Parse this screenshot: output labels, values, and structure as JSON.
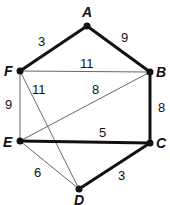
{
  "graph": {
    "nodes": [
      {
        "id": "A",
        "label": "A",
        "x": 87,
        "y": 26
      },
      {
        "id": "B",
        "label": "B",
        "x": 150,
        "y": 72
      },
      {
        "id": "C",
        "label": "C",
        "x": 150,
        "y": 143
      },
      {
        "id": "D",
        "label": "D",
        "x": 79,
        "y": 189
      },
      {
        "id": "E",
        "label": "E",
        "x": 20,
        "y": 141
      },
      {
        "id": "F",
        "label": "F",
        "x": 20,
        "y": 71
      }
    ],
    "edges": [
      {
        "from": "F",
        "to": "A",
        "weight": "3",
        "bold": true
      },
      {
        "from": "A",
        "to": "B",
        "weight": "9",
        "bold": true
      },
      {
        "from": "F",
        "to": "B",
        "weight": "11",
        "bold": false
      },
      {
        "from": "F",
        "to": "D",
        "weight": "11",
        "bold": false
      },
      {
        "from": "E",
        "to": "B",
        "weight": "8",
        "bold": false
      },
      {
        "from": "F",
        "to": "E",
        "weight": "9",
        "bold": false
      },
      {
        "from": "B",
        "to": "C",
        "weight": "8",
        "bold": true
      },
      {
        "from": "E",
        "to": "C",
        "weight": "5",
        "bold": true
      },
      {
        "from": "E",
        "to": "D",
        "weight": "6",
        "bold": false
      },
      {
        "from": "D",
        "to": "C",
        "weight": "3",
        "bold": true
      }
    ]
  },
  "colors": {
    "edge": "#111111",
    "thin_edge": "#555555",
    "node": "#111111"
  }
}
